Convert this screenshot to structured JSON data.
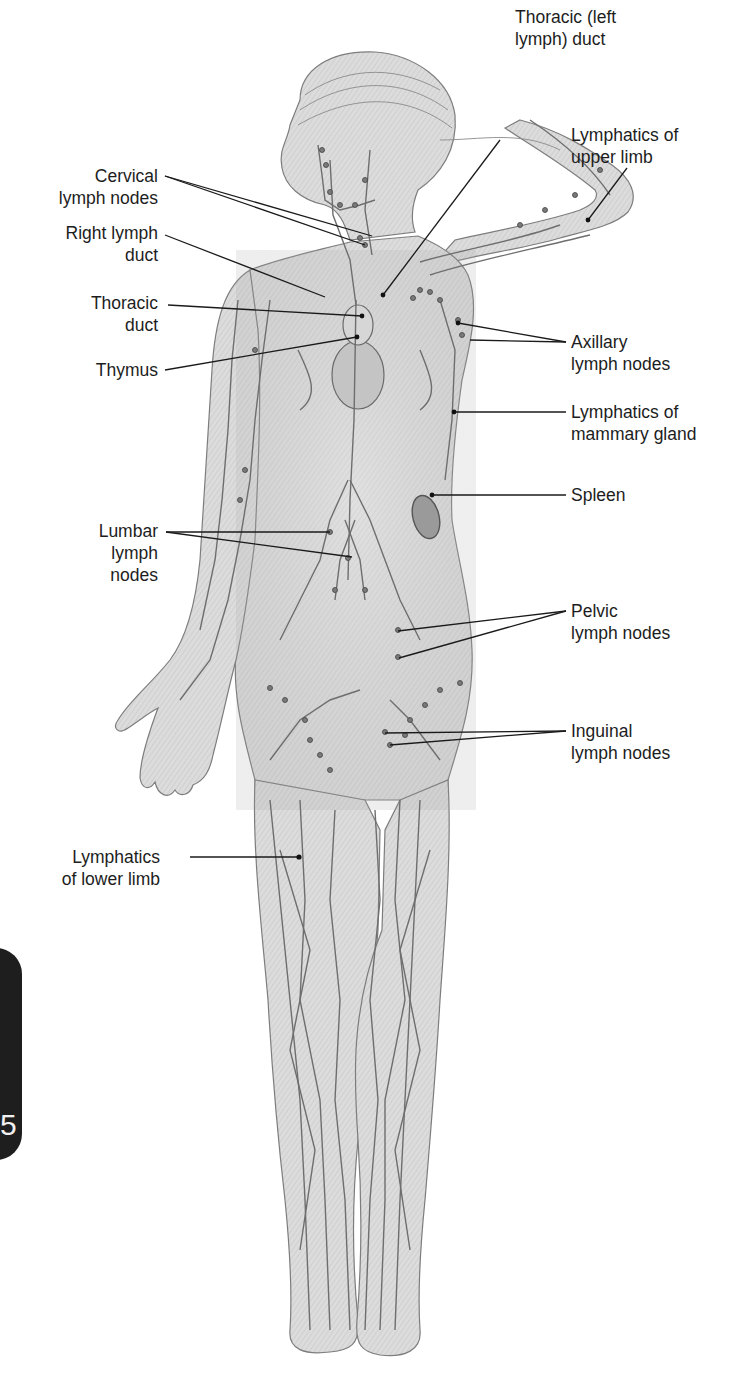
{
  "figure": {
    "colors": {
      "leader_line": "#1a1a1a",
      "skin": "#d9d9d9",
      "vessel": "#6e6e6e",
      "node": "#555555",
      "tab": "#1e1e1e"
    }
  },
  "labels": {
    "thoracic_left_duct": "Thoracic (left\nlymph) duct",
    "lymphatics_upper_limb": "Lymphatics of\nupper limb",
    "cervical_nodes": "Cervical\nlymph nodes",
    "right_lymph_duct": "Right lymph\nduct",
    "thoracic_duct": "Thoracic\nduct",
    "thymus": "Thymus",
    "axillary_nodes": "Axillary\nlymph nodes",
    "mammary_lymphatics": "Lymphatics of\nmammary gland",
    "lumbar_nodes": "Lumbar\nlymph\nnodes",
    "spleen": "Spleen",
    "pelvic_nodes": "Pelvic\nlymph nodes",
    "inguinal_nodes": "Inguinal\nlymph nodes",
    "lymphatics_lower_limb": "Lymphatics\nof lower limb"
  },
  "side_tab": {
    "number": "5"
  }
}
